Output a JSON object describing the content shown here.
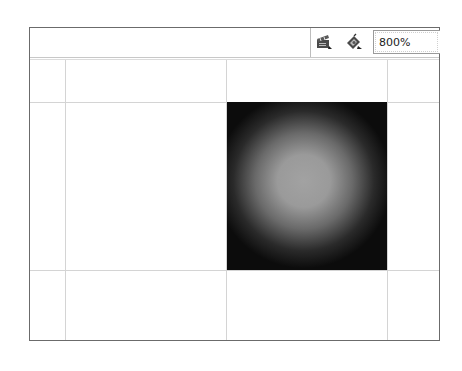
{
  "toolbar": {
    "edit_scene_icon": "clapperboard-icon",
    "edit_symbol_icon": "edit-symbol-icon",
    "zoom_value": "800%"
  },
  "stage": {
    "shape": "square",
    "fill": "radial-gradient",
    "gradient_colors": [
      "#a2a2a2",
      "#0c0c0c"
    ],
    "guide_color": "#d4d4d4"
  }
}
